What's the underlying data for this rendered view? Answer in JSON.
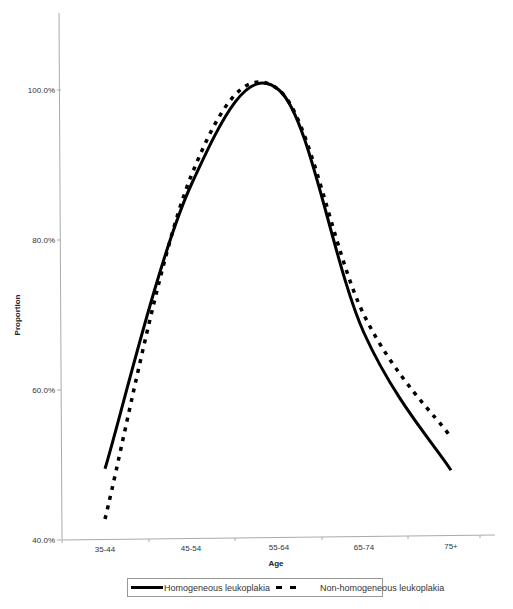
{
  "chart_data": {
    "type": "line",
    "title": "",
    "xlabel": "Age",
    "ylabel": "Proportion",
    "categories": [
      "35-44",
      "45-54",
      "55-64",
      "65-74",
      "75+"
    ],
    "series": [
      {
        "name": "Homogeneous leukoplakia",
        "style": "solid",
        "color": "#000000",
        "values": [
          49.5,
          87.3,
          100.0,
          67.6,
          49.3
        ]
      },
      {
        "name": "Non-homogeneous leukoplakia",
        "style": "dashed",
        "color": "#000000",
        "values": [
          42.8,
          88.5,
          100.0,
          70.0,
          53.7
        ]
      }
    ],
    "ylim": [
      40,
      110
    ],
    "yticks": [
      "40.0%",
      "60.0%",
      "80.0%",
      "100.0%"
    ],
    "ytick_values": [
      40,
      60,
      80,
      100
    ],
    "smoothed": true,
    "grid": false,
    "legend_position": "bottom"
  },
  "legend": {
    "items": [
      {
        "label": "Homogeneous leukoplakia"
      },
      {
        "label": "Non-homogeneous leukoplakia"
      }
    ]
  }
}
